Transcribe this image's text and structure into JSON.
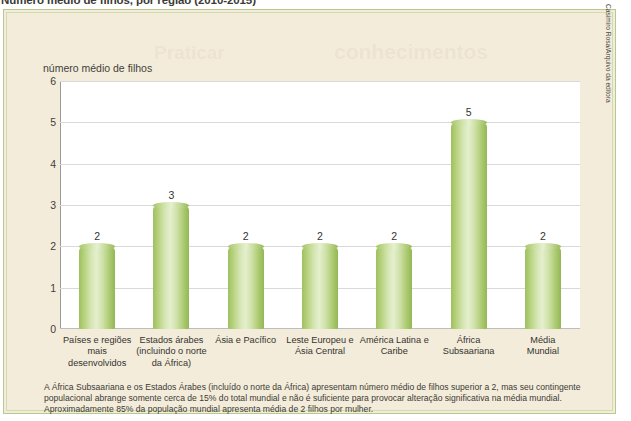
{
  "figure": {
    "title": "Número médio de filhos, por região (2010-2015)",
    "credit": "Casimiro Rosa/Arquivo da editora",
    "ghost_text_a": "Praticar",
    "ghost_text_b": "conhecimentos"
  },
  "caption": {
    "line1": "A África Subsaariana e os Estados Árabes (incluído o norte da África) apresentam número médio de filhos superior a 2, mas seu contingente",
    "line2": "populacional abrange somente cerca de 15% do total mundial e não é suficiente para provocar alteração significativa na média mundial.",
    "line3": "Aproximadamente 85% da população mundial apresenta média de 2 filhos por mulher."
  },
  "chart_data": {
    "type": "bar",
    "title": "Número médio de filhos, por região (2010-2015)",
    "xlabel": "",
    "ylabel": "número médio de filhos",
    "ylim": [
      0,
      6
    ],
    "yticks": [
      0,
      1,
      2,
      3,
      4,
      5,
      6
    ],
    "ytick_labels": [
      "0",
      "1",
      "2",
      "3",
      "4",
      "5",
      "6"
    ],
    "grid": true,
    "legend": "none",
    "categories": [
      "Países e regiões mais desenvolvidos",
      "Estados árabes (incluindo o norte da África)",
      "Ásia e Pacífico",
      "Leste Europeu e Ásia Central",
      "América Latina e Caribe",
      "África Subsaariana",
      "Média Mundial"
    ],
    "category_lines": [
      [
        "Países e regiões",
        "mais",
        "desenvolvidos"
      ],
      [
        "Estados árabes",
        "(incluindo o norte",
        "da África)"
      ],
      [
        "Ásia e Pacífico"
      ],
      [
        "Leste Europeu e",
        "Ásia Central"
      ],
      [
        "América Latina e",
        "Caribe"
      ],
      [
        "África",
        "Subsaariana"
      ],
      [
        "Média",
        "Mundial"
      ]
    ],
    "values": [
      2,
      3,
      2,
      2,
      2,
      5,
      2
    ],
    "value_labels": [
      "2",
      "3",
      "2",
      "2",
      "2",
      "5",
      "2"
    ],
    "bar_color": "#b9d184",
    "panel_background": "#ffffff",
    "figure_background": "#f4ecda",
    "border_color": "#b9c98e",
    "gridline_color": "#d9d9d9"
  }
}
